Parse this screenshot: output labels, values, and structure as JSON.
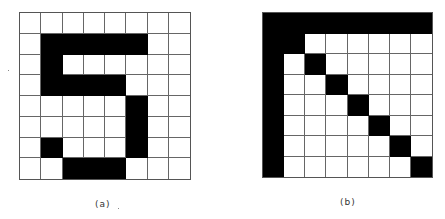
{
  "figures": [
    {
      "id": "a",
      "caption": "(a)",
      "rows": 8,
      "cols": 8,
      "pixels": [
        [
          0,
          0,
          0,
          0,
          0,
          0,
          0,
          0
        ],
        [
          0,
          1,
          1,
          1,
          1,
          1,
          0,
          0
        ],
        [
          0,
          1,
          0,
          0,
          0,
          0,
          0,
          0
        ],
        [
          0,
          1,
          1,
          1,
          1,
          0,
          0,
          0
        ],
        [
          0,
          0,
          0,
          0,
          0,
          1,
          0,
          0
        ],
        [
          0,
          0,
          0,
          0,
          0,
          1,
          0,
          0
        ],
        [
          0,
          1,
          0,
          0,
          0,
          1,
          0,
          0
        ],
        [
          0,
          0,
          1,
          1,
          1,
          0,
          0,
          0
        ]
      ]
    },
    {
      "id": "b",
      "caption": "(b)",
      "rows": 8,
      "cols": 8,
      "pixels": [
        [
          1,
          1,
          1,
          1,
          1,
          1,
          1,
          1
        ],
        [
          1,
          1,
          0,
          0,
          0,
          0,
          0,
          0
        ],
        [
          1,
          0,
          1,
          0,
          0,
          0,
          0,
          0
        ],
        [
          1,
          0,
          0,
          1,
          0,
          0,
          0,
          0
        ],
        [
          1,
          0,
          0,
          0,
          1,
          0,
          0,
          0
        ],
        [
          1,
          0,
          0,
          0,
          0,
          1,
          0,
          0
        ],
        [
          1,
          0,
          0,
          0,
          0,
          0,
          1,
          0
        ],
        [
          1,
          0,
          0,
          0,
          0,
          0,
          0,
          1
        ]
      ]
    }
  ],
  "colors": {
    "on": "#000000",
    "off": "#ffffff",
    "gridline": "#666666"
  }
}
